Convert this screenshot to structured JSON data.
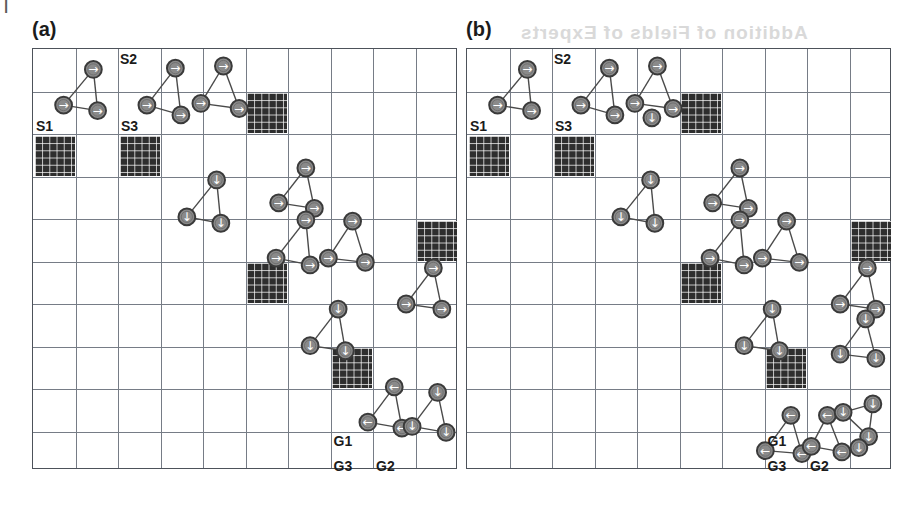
{
  "figure": {
    "page_mark": "|",
    "ghost_text": "Addition of Fields of Experts"
  },
  "grid": {
    "cols": 10,
    "rows": 10,
    "cell_px": 42.5,
    "line_color": "#767c86",
    "border_color": "#4d525a",
    "obstacle_color": "#2e2e2e",
    "robot_fill": "#8a8a8a",
    "robot_stroke": "#3a3a3a",
    "link_color": "#4a4a4a"
  },
  "panels": [
    {
      "id": "a",
      "label": "(a)",
      "obstacles": [
        {
          "c": 5,
          "r": 1
        },
        {
          "c": 0,
          "r": 2
        },
        {
          "c": 2,
          "r": 2
        },
        {
          "c": 9,
          "r": 4
        },
        {
          "c": 5,
          "r": 5
        },
        {
          "c": 7,
          "r": 7
        }
      ],
      "cell_labels": [
        {
          "text": "S2",
          "c": 1,
          "r": 0,
          "pos": "top-right"
        },
        {
          "text": "S1",
          "c": 0,
          "r": 1,
          "pos": "bottom-left"
        },
        {
          "text": "S3",
          "c": 1,
          "r": 1,
          "pos": "bottom-right"
        },
        {
          "text": "G1",
          "c": 7,
          "r": 8,
          "pos": "top-left"
        },
        {
          "text": "G3",
          "c": 7,
          "r": 9,
          "pos": "bottom-left"
        },
        {
          "text": "G2",
          "c": 8,
          "r": 9,
          "pos": "bottom-left"
        }
      ],
      "formations": [
        {
          "name": "S-group-1",
          "dir": "right",
          "robots": [
            [
              1.42,
              0.48
            ],
            [
              0.72,
              1.32
            ],
            [
              1.52,
              1.45
            ]
          ]
        },
        {
          "name": "S-group-2",
          "dir": "right",
          "robots": [
            [
              3.35,
              0.45
            ],
            [
              2.68,
              1.32
            ],
            [
              3.48,
              1.55
            ]
          ]
        },
        {
          "name": "S-group-3",
          "dir": "right",
          "robots": [
            [
              4.48,
              0.4
            ],
            [
              3.95,
              1.28
            ],
            [
              4.85,
              1.4
            ]
          ]
        },
        {
          "name": "mid-group-1",
          "dir": "down",
          "robots": [
            [
              4.32,
              3.08
            ],
            [
              3.62,
              3.95
            ],
            [
              4.42,
              4.1
            ]
          ]
        },
        {
          "name": "mid-group-2",
          "dir": "right",
          "robots": [
            [
              6.42,
              2.8
            ],
            [
              5.78,
              3.62
            ],
            [
              6.62,
              3.75
            ]
          ]
        },
        {
          "name": "mid-group-3",
          "dir": "right",
          "robots": [
            [
              6.42,
              4.02
            ],
            [
              5.72,
              4.92
            ],
            [
              6.52,
              5.08
            ]
          ]
        },
        {
          "name": "mid-group-4",
          "dir": "right",
          "robots": [
            [
              7.52,
              4.05
            ],
            [
              6.95,
              4.92
            ],
            [
              7.82,
              5.02
            ]
          ]
        },
        {
          "name": "right-group-1",
          "dir": "right",
          "robots": [
            [
              9.42,
              5.15
            ],
            [
              8.78,
              6.0
            ],
            [
              9.62,
              6.12
            ]
          ]
        },
        {
          "name": "right-group-2",
          "dir": "down",
          "robots": [
            [
              7.18,
              6.12
            ],
            [
              6.52,
              6.98
            ],
            [
              7.35,
              7.1
            ]
          ]
        },
        {
          "name": "G-group-1",
          "dir": "left",
          "robots": [
            [
              8.5,
              7.95
            ],
            [
              7.88,
              8.78
            ],
            [
              8.68,
              8.92
            ]
          ]
        },
        {
          "name": "G-group-2",
          "dir": "down",
          "robots": [
            [
              9.52,
              8.08
            ],
            [
              8.92,
              8.88
            ],
            [
              9.72,
              9.02
            ]
          ]
        }
      ]
    },
    {
      "id": "b",
      "label": "(b)",
      "obstacles": [
        {
          "c": 5,
          "r": 1
        },
        {
          "c": 0,
          "r": 2
        },
        {
          "c": 2,
          "r": 2
        },
        {
          "c": 9,
          "r": 4
        },
        {
          "c": 5,
          "r": 5
        },
        {
          "c": 7,
          "r": 7
        }
      ],
      "cell_labels": [
        {
          "text": "S2",
          "c": 1,
          "r": 0,
          "pos": "top-right"
        },
        {
          "text": "S1",
          "c": 0,
          "r": 1,
          "pos": "bottom-left"
        },
        {
          "text": "S3",
          "c": 1,
          "r": 1,
          "pos": "bottom-right"
        },
        {
          "text": "G1",
          "c": 7,
          "r": 8,
          "pos": "top-left"
        },
        {
          "text": "G3",
          "c": 7,
          "r": 9,
          "pos": "bottom-left"
        },
        {
          "text": "G2",
          "c": 8,
          "r": 9,
          "pos": "bottom-left"
        }
      ],
      "formations": [
        {
          "name": "S-group-1",
          "dir": "right",
          "robots": [
            [
              1.42,
              0.48
            ],
            [
              0.72,
              1.32
            ],
            [
              1.52,
              1.45
            ]
          ]
        },
        {
          "name": "S-group-2",
          "dir": "right",
          "robots": [
            [
              3.35,
              0.45
            ],
            [
              2.68,
              1.32
            ],
            [
              3.48,
              1.55
            ]
          ]
        },
        {
          "name": "S-group-3",
          "dir": "right",
          "robots": [
            [
              4.48,
              0.4
            ],
            [
              3.95,
              1.28
            ],
            [
              4.85,
              1.4
            ]
          ]
        },
        {
          "name": "S-group-4",
          "dir": "down",
          "robots": [
            [
              4.35,
              1.62
            ]
          ]
        },
        {
          "name": "mid-group-1",
          "dir": "down",
          "robots": [
            [
              4.32,
              3.08
            ],
            [
              3.62,
              3.95
            ],
            [
              4.42,
              4.1
            ]
          ]
        },
        {
          "name": "mid-group-2",
          "dir": "right",
          "robots": [
            [
              6.42,
              2.8
            ],
            [
              5.78,
              3.62
            ],
            [
              6.62,
              3.75
            ]
          ]
        },
        {
          "name": "mid-group-3",
          "dir": "right",
          "robots": [
            [
              6.42,
              4.02
            ],
            [
              5.72,
              4.92
            ],
            [
              6.52,
              5.08
            ]
          ]
        },
        {
          "name": "mid-group-4",
          "dir": "right",
          "robots": [
            [
              7.52,
              4.05
            ],
            [
              6.95,
              4.92
            ],
            [
              7.82,
              5.02
            ]
          ]
        },
        {
          "name": "right-group-1",
          "dir": "right",
          "robots": [
            [
              9.42,
              5.15
            ],
            [
              8.78,
              6.0
            ],
            [
              9.62,
              6.12
            ]
          ]
        },
        {
          "name": "right-group-2",
          "dir": "down",
          "robots": [
            [
              7.18,
              6.12
            ],
            [
              6.52,
              6.98
            ],
            [
              7.35,
              7.1
            ]
          ]
        },
        {
          "name": "right-group-3",
          "dir": "down",
          "robots": [
            [
              9.38,
              6.35
            ],
            [
              8.78,
              7.18
            ],
            [
              9.62,
              7.28
            ]
          ]
        },
        {
          "name": "G-group-1",
          "dir": "left",
          "robots": [
            [
              7.62,
              8.62
            ],
            [
              7.02,
              9.45
            ],
            [
              7.88,
              9.52
            ]
          ]
        },
        {
          "name": "G-group-2",
          "dir": "left",
          "robots": [
            [
              8.48,
              8.62
            ],
            [
              8.1,
              9.35
            ],
            [
              8.82,
              9.48
            ]
          ]
        },
        {
          "name": "G-group-3",
          "dir": "down",
          "robots": [
            [
              8.85,
              8.55
            ],
            [
              9.55,
              8.35
            ],
            [
              9.45,
              9.12
            ]
          ]
        },
        {
          "name": "G-group-4",
          "dir": "down",
          "robots": [
            [
              9.22,
              9.38
            ]
          ]
        }
      ]
    }
  ],
  "glyphs": {
    "right": "→",
    "down": "↓",
    "left": "←"
  }
}
